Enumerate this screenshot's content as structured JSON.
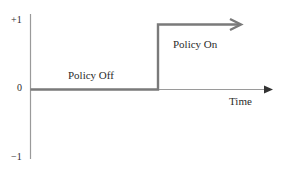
{
  "diagram": {
    "type": "step-function",
    "y_axis": {
      "ticks": [
        {
          "label": "+1",
          "value": 1
        },
        {
          "label": "0",
          "value": 0
        },
        {
          "label": "−1",
          "value": -1
        }
      ]
    },
    "x_axis": {
      "label": "Time"
    },
    "segments": [
      {
        "label": "Policy Off",
        "value": 0
      },
      {
        "label": "Policy On",
        "value": 1
      }
    ],
    "colors": {
      "step_line": "#7a7a7a",
      "axis": "#9a9a9a",
      "arrowhead": "#333333",
      "text": "#2b2b2b"
    }
  }
}
